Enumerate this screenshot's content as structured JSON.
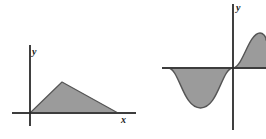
{
  "figure": {
    "background_color": "#ffffff",
    "stroke_color": "#4d4d4d",
    "fill_color": "#9b9b9b",
    "axis_color": "#3d3d3d",
    "width": 266,
    "height": 139
  },
  "panels": {
    "left": {
      "name": "triangular-region-plot",
      "y_axis_label": "y",
      "x_axis_label": "x"
    },
    "right": {
      "name": "sine-wave-region-plot",
      "y_axis_label": "y",
      "x_axis_label": ""
    }
  },
  "chart_data": [
    {
      "type": "area",
      "title": "",
      "subtitle": "",
      "xlabel": "x",
      "ylabel": "y",
      "legend": [],
      "grid": false,
      "axes": {
        "x_axis_drawn": true,
        "y_axis_drawn": true,
        "origin_px": [
          30,
          113
        ],
        "x_axis_span_px": [
          12,
          136
        ],
        "y_axis_span_px": [
          45,
          126
        ]
      },
      "description": "Shaded triangular region above the x-axis, rising from the origin to a peak then falling back to the axis",
      "shape": "triangle",
      "x": [
        0,
        32,
        88
      ],
      "y": [
        0,
        31,
        0
      ],
      "vertices_px": [
        [
          30,
          113
        ],
        [
          62,
          82
        ],
        [
          118,
          113
        ]
      ],
      "xlim": [
        -18,
        106
      ],
      "ylim": [
        -13,
        68
      ],
      "fill": true,
      "fill_color": "#9b9b9b"
    },
    {
      "type": "area",
      "title": "",
      "subtitle": "",
      "xlabel": "",
      "ylabel": "y",
      "legend": [],
      "grid": false,
      "axes": {
        "x_axis_drawn": true,
        "y_axis_drawn": true,
        "origin_px": [
          233,
          68
        ],
        "x_axis_span_px": [
          162,
          266
        ],
        "y_axis_span_px": [
          4,
          130
        ]
      },
      "description": "Shaded region between a sine-like curve and the x-axis: one negative hump left of the y-axis and one positive hump right of the y-axis",
      "shape": "sine",
      "x": [
        -65,
        -48,
        -32,
        -16,
        0,
        16,
        33,
        49
      ],
      "y": [
        0,
        -28,
        -40,
        -28,
        0,
        25,
        35,
        30
      ],
      "negative_hump_px": {
        "x_start": 168,
        "x_end": 233,
        "min_y": 108
      },
      "positive_hump_px": {
        "x_start": 233,
        "x_end": 266,
        "max_y": 33
      },
      "xlim": [
        -71,
        33
      ],
      "ylim": [
        -62,
        64
      ],
      "fill": true,
      "fill_color": "#9b9b9b"
    }
  ]
}
